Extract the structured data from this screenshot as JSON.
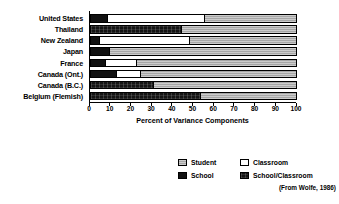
{
  "chart_data": {
    "type": "bar",
    "orientation": "horizontal",
    "stacked": true,
    "title": "",
    "xlabel": "Percent of Variance Components",
    "ylabel": "",
    "xlim": [
      0,
      100
    ],
    "xticks": [
      0,
      10,
      20,
      30,
      40,
      50,
      60,
      70,
      80,
      90,
      100
    ],
    "xtick_labels": [
      "0",
      "10",
      "20",
      "30",
      "40",
      "50",
      "60",
      "70",
      "80",
      "90",
      "100"
    ],
    "grid": false,
    "legend_position": "bottom-right",
    "categories": [
      "United States",
      "Thailand",
      "New Zealand",
      "Japan",
      "France",
      "Canada (Ont.)",
      "Canada (B.C.)",
      "Belgium (Flemish)"
    ],
    "series": [
      {
        "name": "School",
        "key": "school",
        "color": "#111111",
        "values": [
          8,
          0,
          4,
          9,
          7,
          12,
          0,
          0
        ]
      },
      {
        "name": "School/Classroom",
        "key": "schoolclassroom",
        "color": "#141414",
        "values": [
          0,
          44,
          0,
          0,
          0,
          0,
          30,
          53
        ]
      },
      {
        "name": "Classroom",
        "key": "classroom",
        "color": "#ffffff",
        "values": [
          47,
          0,
          44,
          0,
          15,
          12,
          0,
          0
        ]
      },
      {
        "name": "Student",
        "key": "student",
        "color": "#b0b0b0",
        "values": [
          45,
          56,
          52,
          91,
          78,
          76,
          70,
          47
        ]
      }
    ],
    "rows": [
      {
        "category": "United States",
        "segments": [
          {
            "key": "school",
            "value": 8
          },
          {
            "key": "classroom",
            "value": 47
          },
          {
            "key": "student",
            "value": 45
          }
        ]
      },
      {
        "category": "Thailand",
        "segments": [
          {
            "key": "schoolclassroom",
            "value": 44
          },
          {
            "key": "student",
            "value": 56
          }
        ]
      },
      {
        "category": "New Zealand",
        "segments": [
          {
            "key": "school",
            "value": 4
          },
          {
            "key": "classroom",
            "value": 44
          },
          {
            "key": "student",
            "value": 52
          }
        ]
      },
      {
        "category": "Japan",
        "segments": [
          {
            "key": "school",
            "value": 9
          },
          {
            "key": "student",
            "value": 91
          }
        ]
      },
      {
        "category": "France",
        "segments": [
          {
            "key": "school",
            "value": 7
          },
          {
            "key": "classroom",
            "value": 15
          },
          {
            "key": "student",
            "value": 78
          }
        ]
      },
      {
        "category": "Canada (Ont.)",
        "segments": [
          {
            "key": "school",
            "value": 12
          },
          {
            "key": "classroom",
            "value": 12
          },
          {
            "key": "student",
            "value": 76
          }
        ]
      },
      {
        "category": "Canada (B.C.)",
        "segments": [
          {
            "key": "schoolclassroom",
            "value": 30
          },
          {
            "key": "student",
            "value": 70
          }
        ]
      },
      {
        "category": "Belgium (Flemish)",
        "segments": [
          {
            "key": "schoolclassroom",
            "value": 53
          },
          {
            "key": "student",
            "value": 47
          }
        ]
      }
    ],
    "legend": [
      {
        "label": "Student",
        "key": "student",
        "color": "#b0b0b0"
      },
      {
        "label": "Classroom",
        "key": "classroom",
        "color": "#ffffff"
      },
      {
        "label": "School",
        "key": "school",
        "color": "#111111"
      },
      {
        "label": "School/Classroom",
        "key": "schoolclassroom",
        "color": "#141414"
      }
    ],
    "annotations": [
      "(From Wolfe, 1986)"
    ]
  },
  "source_note": "(From Wolfe, 1986)"
}
